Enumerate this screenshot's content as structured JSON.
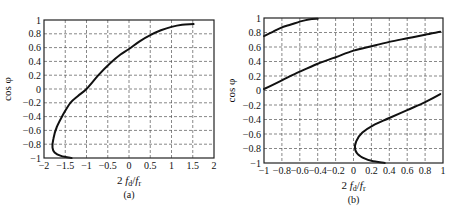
{
  "chart_data": [
    {
      "id": "a",
      "type": "line",
      "caption": "(a)",
      "xlabel": "2 f_d / f_r",
      "xlabel_parts": {
        "lead": "2",
        "f1": "f",
        "sub1": "d",
        "slash": "/",
        "f2": "f",
        "sub2": "r"
      },
      "ylabel": "cos φ",
      "xlim": [
        -2,
        2
      ],
      "ylim": [
        -1,
        1
      ],
      "xticks": [
        -2,
        -1.5,
        -1,
        -0.5,
        0,
        0.5,
        1,
        1.5,
        2
      ],
      "xtick_labels": [
        "−2",
        "−1.5",
        "−1",
        "−0.5",
        "0",
        "0.5",
        "1",
        "1.5",
        "2"
      ],
      "yticks": [
        -1,
        -0.8,
        -0.6,
        -0.4,
        -0.2,
        0,
        0.2,
        0.4,
        0.6,
        0.8,
        1
      ],
      "ytick_labels": [
        "−1",
        "−0.8",
        "−0.6",
        "−0.4",
        "−0.2",
        "0",
        "0.2",
        "0.4",
        "0.6",
        "0.8",
        "1"
      ],
      "grid": "dashed",
      "series": [
        {
          "name": "curve",
          "x": [
            -1.35,
            -1.6,
            -1.75,
            -1.8,
            -1.78,
            -1.7,
            -1.55,
            -1.38,
            -1.2,
            -1.0,
            -0.72,
            -0.45,
            -0.2,
            0.0,
            0.25,
            0.5,
            0.75,
            1.0,
            1.25,
            1.52
          ],
          "y": [
            -1.0,
            -0.97,
            -0.92,
            -0.85,
            -0.72,
            -0.55,
            -0.37,
            -0.2,
            -0.1,
            0.0,
            0.2,
            0.37,
            0.5,
            0.58,
            0.69,
            0.78,
            0.85,
            0.9,
            0.93,
            0.94
          ]
        }
      ]
    },
    {
      "id": "b",
      "type": "line",
      "caption": "(b)",
      "xlabel": "2 f_d / f_r",
      "xlabel_parts": {
        "lead": "2",
        "f1": "f",
        "sub1": "d",
        "slash": "/",
        "f2": "f",
        "sub2": "r"
      },
      "ylabel": "cos φ",
      "xlim": [
        -1,
        1
      ],
      "ylim": [
        -1,
        1
      ],
      "xticks": [
        -1,
        -0.8,
        -0.6,
        -0.4,
        -0.2,
        0,
        0.2,
        0.4,
        0.6,
        0.8,
        1
      ],
      "xtick_labels": [
        "−1",
        "−0.8",
        "−0.6",
        "−0.4",
        "−0.2",
        "0",
        "0.2",
        "0.4",
        "0.6",
        "0.8",
        "1"
      ],
      "yticks": [
        -1,
        -0.8,
        -0.6,
        -0.4,
        -0.2,
        0,
        0.2,
        0.4,
        0.6,
        0.8,
        1
      ],
      "ytick_labels": [
        "−1",
        "−0.8",
        "−0.6",
        "−0.4",
        "−0.2",
        "0",
        "0.2",
        "0.4",
        "0.6",
        "0.8",
        "1"
      ],
      "grid": "dashed",
      "series": [
        {
          "name": "upper-branch",
          "x": [
            -1.0,
            -0.9,
            -0.8,
            -0.7,
            -0.6,
            -0.5,
            -0.4
          ],
          "y": [
            0.75,
            0.81,
            0.87,
            0.91,
            0.95,
            0.98,
            0.99
          ]
        },
        {
          "name": "middle-branch",
          "x": [
            -1.0,
            -0.8,
            -0.6,
            -0.4,
            -0.2,
            0.0,
            0.2,
            0.4,
            0.6,
            0.8,
            0.97
          ],
          "y": [
            0.02,
            0.14,
            0.26,
            0.37,
            0.46,
            0.55,
            0.61,
            0.67,
            0.72,
            0.77,
            0.81
          ]
        },
        {
          "name": "lower-branch",
          "x": [
            0.35,
            0.2,
            0.08,
            0.02,
            0.03,
            0.1,
            0.22,
            0.4,
            0.6,
            0.8,
            0.97
          ],
          "y": [
            -1.0,
            -0.97,
            -0.91,
            -0.82,
            -0.7,
            -0.58,
            -0.48,
            -0.38,
            -0.27,
            -0.16,
            -0.05
          ]
        }
      ]
    }
  ]
}
